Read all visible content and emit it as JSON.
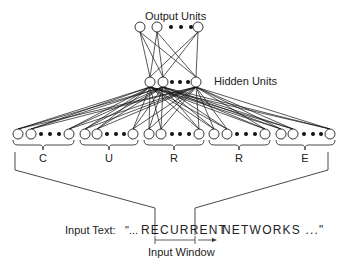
{
  "figure": {
    "output_label": "Output Units",
    "hidden_label": "Hidden Units",
    "input_text_label": "Input Text:",
    "input_text_prefix": "\"...",
    "input_text_window": "RECURRENT",
    "input_text_suffix": "NETWORKS ...\"",
    "window_label": "Input Window",
    "input_groups": [
      {
        "letter": "C"
      },
      {
        "letter": "U"
      },
      {
        "letter": "R"
      },
      {
        "letter": "R"
      },
      {
        "letter": "E"
      }
    ]
  },
  "layout": {
    "output_y": 27,
    "output_nodes_x": [
      140,
      157,
      198
    ],
    "output_dots_x": [
      171,
      181,
      191
    ],
    "hidden_y": 82,
    "hidden_nodes_x": [
      150,
      163,
      196
    ],
    "hidden_dots_x": [
      172,
      180,
      188
    ],
    "input_y": 134,
    "groups": [
      {
        "nodes_x": [
          18,
          31,
          69
        ],
        "dots_x": [
          41,
          50,
          59
        ],
        "cx": 43
      },
      {
        "nodes_x": [
          85,
          97,
          133
        ],
        "dots_x": [
          107,
          116,
          124
        ],
        "cx": 109
      },
      {
        "nodes_x": [
          149,
          161,
          199
        ],
        "dots_x": [
          172,
          180,
          189
        ],
        "cx": 174
      },
      {
        "nodes_x": [
          214,
          227,
          265
        ],
        "dots_x": [
          237,
          246,
          255
        ],
        "cx": 239
      },
      {
        "nodes_x": [
          281,
          293,
          330
        ],
        "dots_x": [
          304,
          313,
          321
        ],
        "cx": 305
      }
    ],
    "colors": {
      "ink": "#111111",
      "background": "#ffffff"
    }
  }
}
